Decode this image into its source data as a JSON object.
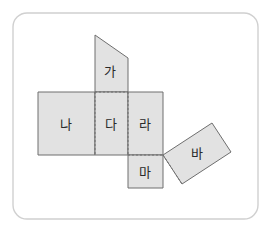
{
  "canvas": {
    "width": 273,
    "height": 233,
    "background": "#ffffff"
  },
  "card": {
    "x": 13,
    "y": 13,
    "width": 245,
    "height": 206,
    "corner_radius": 14,
    "border_color": "#d0d0d0",
    "fill": "#ffffff"
  },
  "figure": {
    "face_fill": "#e2e2e2",
    "edge_color": "#6e6e6e",
    "fold_line_color": "#6e6e6e",
    "label_color": "#2a2a2a",
    "faces": [
      {
        "id": "face-ga",
        "label": "가",
        "shape": "trapezoid",
        "points": "95,35 128,58 128,92 95,92",
        "label_x": 110,
        "label_y": 71
      },
      {
        "id": "face-na",
        "label": "나",
        "shape": "rectangle",
        "points": "38,92 95,92 95,155 38,155",
        "label_x": 66,
        "label_y": 124
      },
      {
        "id": "face-da",
        "label": "다",
        "shape": "rectangle",
        "points": "95,92 128,92 128,155 95,155",
        "label_x": 111,
        "label_y": 124
      },
      {
        "id": "face-ra",
        "label": "라",
        "shape": "rectangle",
        "points": "128,92 163,92 163,155 128,155",
        "label_x": 145,
        "label_y": 124
      },
      {
        "id": "face-ma",
        "label": "마",
        "shape": "rectangle",
        "points": "128,155 163,155 163,188 128,188",
        "label_x": 145,
        "label_y": 172
      },
      {
        "id": "face-ba",
        "label": "바",
        "shape": "rotated-rectangle",
        "points": "163,155 212,123 231,152 182,184",
        "label_x": 197,
        "label_y": 153
      }
    ],
    "fold_lines": [
      {
        "id": "fold-ga-da",
        "points": "95,92 128,92"
      },
      {
        "id": "fold-na-da",
        "points": "95,92 95,155"
      },
      {
        "id": "fold-da-ra",
        "points": "128,92 128,155"
      },
      {
        "id": "fold-da-ma",
        "points": "128,155 163,155"
      },
      {
        "id": "fold-ra-ba",
        "points": "163,155 182,184"
      }
    ]
  }
}
